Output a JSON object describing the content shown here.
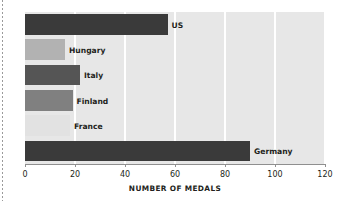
{
  "chart_data": {
    "type": "bar",
    "orientation": "horizontal",
    "title": "",
    "xlabel": "NUMBER OF MEDALS",
    "ylabel": "TOP SIX WINNING NATIONS",
    "xlim": [
      0,
      120
    ],
    "xticks": [
      0,
      20,
      40,
      60,
      80,
      100,
      120
    ],
    "xtick_labels": [
      "0",
      "20",
      "40",
      "60",
      "80",
      "100",
      "120"
    ],
    "grid": "vertical-white",
    "legend": "none",
    "plot_background": "#e7e7e7",
    "categories": [
      "US",
      "Hungary",
      "Italy",
      "Finland",
      "France",
      "Germany"
    ],
    "values": [
      57,
      16,
      22,
      19,
      18,
      90
    ],
    "bar_colors": [
      "#3a3a3a",
      "#b2b2b2",
      "#555555",
      "#808080",
      "#e2e2e2",
      "#3a3a3a"
    ],
    "bars": [
      {
        "label": "US",
        "value": 57,
        "color": "#3a3a3a"
      },
      {
        "label": "Hungary",
        "value": 16,
        "color": "#b2b2b2"
      },
      {
        "label": "Italy",
        "value": 22,
        "color": "#555555"
      },
      {
        "label": "Finland",
        "value": 19,
        "color": "#808080"
      },
      {
        "label": "France",
        "value": 18,
        "color": "#e2e2e2"
      },
      {
        "label": "Germany",
        "value": 90,
        "color": "#3a3a3a"
      }
    ]
  }
}
